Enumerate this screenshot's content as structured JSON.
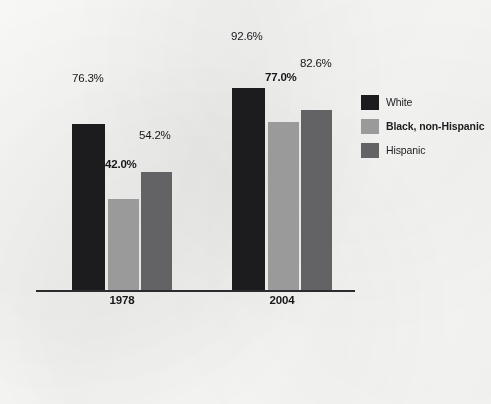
{
  "chart_data": {
    "type": "bar",
    "title": "",
    "subtitle": "",
    "xlabel": "",
    "ylabel": "",
    "categories": [
      "1978",
      "2004"
    ],
    "ylim": [
      0,
      100
    ],
    "grid": false,
    "legend_position": "right",
    "value_suffix": "%",
    "series": [
      {
        "name": "White",
        "color": "#1c1c1e",
        "bold_labels": false,
        "values": [
          76.3,
          92.6
        ],
        "labels": [
          "76.3%",
          "92.6%"
        ]
      },
      {
        "name": "Black, non-Hispanic",
        "color": "#9a9a9a",
        "bold_labels": true,
        "values": [
          42.0,
          77.0
        ],
        "labels": [
          "42.0%",
          "77.0%"
        ]
      },
      {
        "name": "Hispanic",
        "color": "#636365",
        "bold_labels": false,
        "values": [
          54.2,
          82.6
        ],
        "labels": [
          "54.2%",
          "82.6%"
        ]
      }
    ]
  },
  "axis": {
    "tick_labels": [
      "1978",
      "2004"
    ]
  },
  "legend": {
    "entries": [
      {
        "label": "White",
        "color": "#1c1c1e",
        "bold": false
      },
      {
        "label": "Black, non-Hispanic",
        "color": "#9a9a9a",
        "bold": true
      },
      {
        "label": "Hispanic",
        "color": "#636365",
        "bold": false
      }
    ]
  },
  "bar_labels": {
    "g0s0": "76.3%",
    "g0s1": "42.0%",
    "g0s2": "54.2%",
    "g1s0": "92.6%",
    "g1s1": "77.0%",
    "g1s2": "82.6%"
  }
}
